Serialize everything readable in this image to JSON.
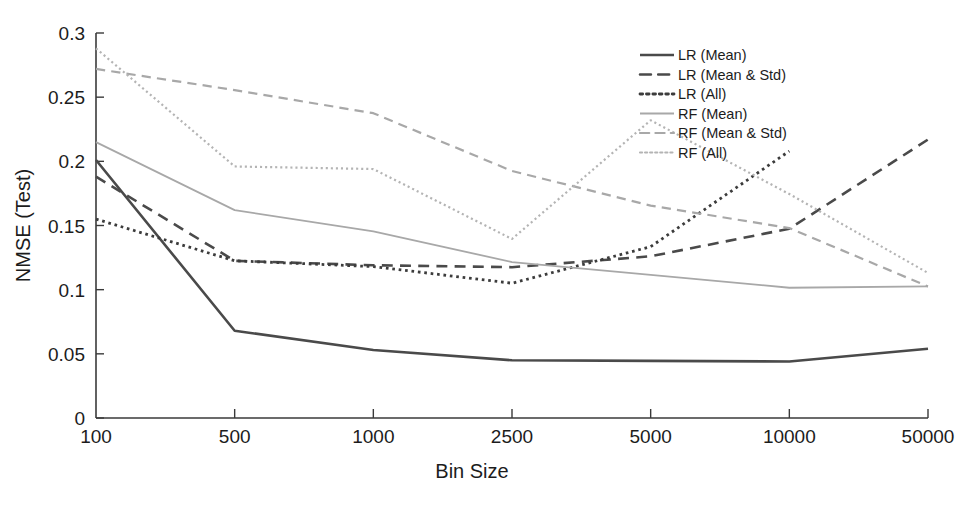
{
  "chart_data": {
    "type": "line",
    "title": "",
    "xlabel": "Bin Size",
    "ylabel": "NMSE (Test)",
    "categories": [
      "100",
      "500",
      "1000",
      "2500",
      "5000",
      "10000",
      "50000"
    ],
    "x_tick_labels": [
      "100",
      "500",
      "1000",
      "2500",
      "5000",
      "10000",
      "50000"
    ],
    "y_tick_labels": [
      "0",
      "0.05",
      "0.1",
      "0.15",
      "0.2",
      "0.25",
      "0.3"
    ],
    "y_ticks": [
      0,
      0.05,
      0.1,
      0.15,
      0.2,
      0.25,
      0.3
    ],
    "ylim": [
      0,
      0.3
    ],
    "grid": false,
    "legend_position": "top-right",
    "series": [
      {
        "name": "LR (Mean)",
        "style": "solid",
        "color": "#4a4a4a",
        "width": 2.6,
        "values": [
          0.201,
          0.068,
          0.053,
          0.045,
          0.0445,
          0.044,
          0.054
        ]
      },
      {
        "name": "LR (Mean & Std)",
        "style": "dashed",
        "color": "#4a4a4a",
        "width": 2.6,
        "values": [
          0.188,
          0.1225,
          0.119,
          0.1175,
          0.126,
          0.1475,
          0.217
        ]
      },
      {
        "name": "LR (All)",
        "style": "dotted",
        "color": "#3c3c3c",
        "width": 2.8,
        "values": [
          0.155,
          0.1225,
          0.118,
          0.105,
          0.1335,
          0.208,
          null
        ]
      },
      {
        "name": "RF (Mean)",
        "style": "solid",
        "color": "#a8a8a8",
        "width": 1.8,
        "values": [
          0.215,
          0.162,
          0.1455,
          0.1215,
          0.1115,
          0.1015,
          0.1025
        ]
      },
      {
        "name": "RF (Mean & Std)",
        "style": "dashed",
        "color": "#a8a8a8",
        "width": 2.2,
        "values": [
          0.272,
          0.2555,
          0.2375,
          0.1925,
          0.1655,
          0.148,
          0.1025
        ]
      },
      {
        "name": "RF (All)",
        "style": "dotted",
        "color": "#b4b4b4",
        "width": 2.2,
        "values": [
          0.288,
          0.196,
          0.194,
          0.1395,
          0.232,
          0.1745,
          0.113
        ]
      }
    ]
  },
  "legend": {
    "entries": [
      {
        "label": "LR (Mean)"
      },
      {
        "label": "LR (Mean & Std)"
      },
      {
        "label": "LR (All)"
      },
      {
        "label": "RF (Mean)"
      },
      {
        "label": "RF (Mean & Std)"
      },
      {
        "label": "RF (All)"
      }
    ]
  }
}
